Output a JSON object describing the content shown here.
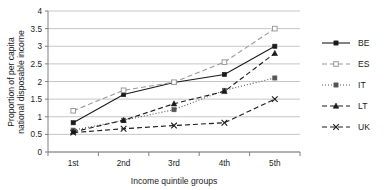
{
  "chart_data": {
    "type": "line",
    "title": "",
    "xlabel": "Income quintile groups",
    "ylabel": "Proportion of per capita national disposable income",
    "categories": [
      "1st",
      "2nd",
      "3rd",
      "4th",
      "5th"
    ],
    "ylim": [
      0,
      4
    ],
    "ytick_labels": [
      "0",
      "0.5",
      "1",
      "1.5",
      "2",
      "2.5",
      "3",
      "3.5",
      "4"
    ],
    "ytick_values": [
      0,
      0.5,
      1,
      1.5,
      2,
      2.5,
      3,
      3.5,
      4
    ],
    "grid": "horizontal",
    "legend_position": "right",
    "series": [
      {
        "name": "BE",
        "values": [
          0.83,
          1.63,
          1.97,
          2.2,
          3.0
        ],
        "line_style": "solid",
        "marker": "filled-square",
        "color": "#1a1a1a"
      },
      {
        "name": "ES",
        "values": [
          1.17,
          1.75,
          1.98,
          2.55,
          3.5
        ],
        "line_style": "dashed",
        "marker": "open-square",
        "color": "#9a9a9a"
      },
      {
        "name": "IT",
        "values": [
          0.62,
          0.9,
          1.2,
          1.75,
          2.1
        ],
        "line_style": "dotted",
        "marker": "filled-square",
        "color": "#555555"
      },
      {
        "name": "LT",
        "values": [
          0.57,
          0.9,
          1.37,
          1.72,
          2.8
        ],
        "line_style": "dashed",
        "marker": "filled-triangle",
        "color": "#1a1a1a"
      },
      {
        "name": "UK",
        "values": [
          0.55,
          0.66,
          0.75,
          0.83,
          1.5
        ],
        "line_style": "dashed",
        "marker": "cross-x",
        "color": "#1a1a1a"
      }
    ]
  },
  "axes": {
    "y_title_line1": "Proportion of per capita",
    "y_title_line2": "national disposable income",
    "x_title": "Income quintile groups"
  },
  "legend": {
    "entries": [
      {
        "label": "BE"
      },
      {
        "label": "ES"
      },
      {
        "label": "IT"
      },
      {
        "label": "LT"
      },
      {
        "label": "UK"
      }
    ]
  }
}
